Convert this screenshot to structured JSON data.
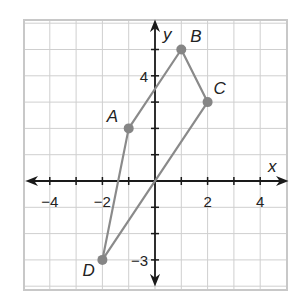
{
  "chart_data": {
    "type": "scatter",
    "title": "",
    "xlabel": "x",
    "ylabel": "y",
    "xlim": [
      -5,
      5
    ],
    "ylim": [
      -4,
      6
    ],
    "grid": true,
    "tick_labels": {
      "x": [
        {
          "value": -4,
          "label": "−4"
        },
        {
          "value": -2,
          "label": "−2"
        },
        {
          "value": 2,
          "label": "2"
        },
        {
          "value": 4,
          "label": "4"
        }
      ],
      "y": [
        {
          "value": 4,
          "label": "4"
        },
        {
          "value": -3,
          "label": "−3"
        }
      ]
    },
    "points": [
      {
        "name": "A",
        "x": -1,
        "y": 2
      },
      {
        "name": "B",
        "x": 1,
        "y": 5
      },
      {
        "name": "C",
        "x": 2,
        "y": 3
      },
      {
        "name": "D",
        "x": -2,
        "y": -3
      }
    ],
    "polygon": [
      "A",
      "B",
      "C",
      "D"
    ]
  },
  "colors": {
    "grid": "#cfcfcf",
    "border": "#c8c8c8",
    "axis": "#1a1a1a",
    "shape": "#8a8a8a",
    "point": "#858585",
    "text": "#222222"
  }
}
